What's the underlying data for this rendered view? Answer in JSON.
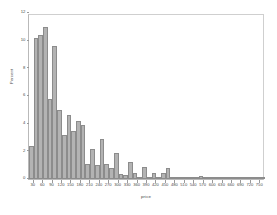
{
  "chart_data": {
    "type": "bar",
    "title": "",
    "subtitle": "",
    "xlabel": "price",
    "ylabel": "Percent",
    "xlim": [
      15,
      765
    ],
    "ylim": [
      0,
      12
    ],
    "grid": false,
    "legend": null,
    "bin_width": 15,
    "x_tick_labels": [
      "30",
      "60",
      "90",
      "120",
      "150",
      "180",
      "210",
      "240",
      "270",
      "300",
      "330",
      "360",
      "390",
      "420",
      "450",
      "480",
      "510",
      "540",
      "570",
      "600",
      "630",
      "660",
      "690",
      "720",
      "750"
    ],
    "x_tick_values": [
      30,
      60,
      90,
      120,
      150,
      180,
      210,
      240,
      270,
      300,
      330,
      360,
      390,
      420,
      450,
      480,
      510,
      540,
      570,
      600,
      630,
      660,
      690,
      720,
      750
    ],
    "y_tick_labels": [
      "0",
      "2",
      "4",
      "6",
      "8",
      "10",
      "12"
    ],
    "y_tick_values": [
      0,
      2,
      4,
      6,
      8,
      10,
      12
    ],
    "bar_color": "#b3b3b3",
    "bar_edge_color": "#8c8c8c",
    "axis_color": "#9a9a9a",
    "text_color": "#4a4a4a",
    "bin_centers": [
      22,
      37,
      52,
      67,
      82,
      97,
      112,
      127,
      142,
      157,
      172,
      187,
      202,
      217,
      232,
      247,
      262,
      277,
      292,
      307,
      322,
      337,
      352,
      367,
      382,
      397,
      412,
      427,
      442,
      457,
      472,
      487,
      502,
      517,
      532,
      547,
      562,
      577,
      592,
      607,
      622,
      637,
      652,
      667,
      682,
      697,
      712,
      727,
      742,
      757
    ],
    "values": [
      2.4,
      10.2,
      10.4,
      11.0,
      5.8,
      9.6,
      5.0,
      3.2,
      4.6,
      3.5,
      4.2,
      3.9,
      1.1,
      2.2,
      1.0,
      2.9,
      1.1,
      0.8,
      1.9,
      0.35,
      0.3,
      1.25,
      0.4,
      0.15,
      0.85,
      0.1,
      0.45,
      0.1,
      0.45,
      0.8,
      0.05,
      0.05,
      0.1,
      0.08,
      0.15,
      0.05,
      0.2,
      0.05,
      0.06,
      0.12,
      0.05,
      0.05,
      0.15,
      0.05,
      0.05,
      0.1,
      0.05,
      0.12,
      0.05,
      0.15
    ]
  }
}
